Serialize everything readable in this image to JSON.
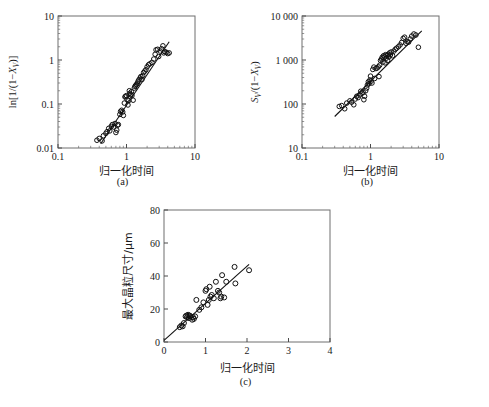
{
  "figure": {
    "panels": [
      {
        "id": "a",
        "caption": "(a)",
        "xlabel": "归一化时间",
        "ylabel_parts": {
          "prefix": "ln[1/(1−",
          "symbol": "X",
          "subscript": "V",
          "suffix": ")]"
        },
        "ylabel_text": "ln[1/(1−XV)]",
        "xticks": [
          "0.1",
          "1",
          "10"
        ],
        "yticks": [
          "0.01",
          "0.1",
          "1",
          "10"
        ]
      },
      {
        "id": "b",
        "caption": "(b)",
        "xlabel": "归一化时间",
        "ylabel_parts": {
          "prefix": "S",
          "sub1": "V",
          "mid": "/(1−",
          "symbol": "X",
          "subscript": "V",
          "suffix": ")"
        },
        "ylabel_text": "SV/(1−XV)",
        "xticks": [
          "0.1",
          "1",
          "10"
        ],
        "yticks": [
          "10",
          "100",
          "1 000",
          "10 000"
        ]
      },
      {
        "id": "c",
        "caption": "(c)",
        "xlabel": "归一化时间",
        "ylabel_text": "最大晶粒尺寸/μm",
        "xticks": [
          "0",
          "1",
          "2",
          "3",
          "4"
        ],
        "yticks": [
          "0",
          "20",
          "40",
          "60",
          "80"
        ]
      }
    ],
    "colors": {
      "axis": "#3a3a3a",
      "marker_stroke": "#111111",
      "fit_line": "#111111",
      "background": "#ffffff"
    }
  },
  "chart_data": [
    {
      "type": "scatter",
      "panel": "a",
      "title": "",
      "xlabel": "归一化时间",
      "ylabel": "ln[1/(1−XV)]",
      "xscale": "log",
      "yscale": "log",
      "xlim": [
        0.1,
        10
      ],
      "ylim": [
        0.01,
        10
      ],
      "xticks": [
        0.1,
        1,
        10
      ],
      "yticks": [
        0.01,
        0.1,
        1,
        10
      ],
      "grid": false,
      "legend": null,
      "fit_line": {
        "x": [
          0.42,
          4.2
        ],
        "y": [
          0.0125,
          2.6
        ]
      },
      "points": [
        [
          0.37,
          0.015
        ],
        [
          0.4,
          0.0165
        ],
        [
          0.44,
          0.0145
        ],
        [
          0.46,
          0.019
        ],
        [
          0.5,
          0.0215
        ],
        [
          0.52,
          0.0235
        ],
        [
          0.55,
          0.028
        ],
        [
          0.57,
          0.0245
        ],
        [
          0.6,
          0.031
        ],
        [
          0.62,
          0.034
        ],
        [
          0.65,
          0.03
        ],
        [
          0.68,
          0.036
        ],
        [
          0.7,
          0.0225
        ],
        [
          0.72,
          0.0255
        ],
        [
          0.74,
          0.033
        ],
        [
          0.76,
          0.034
        ],
        [
          0.8,
          0.058
        ],
        [
          0.82,
          0.068
        ],
        [
          0.85,
          0.072
        ],
        [
          0.88,
          0.066
        ],
        [
          0.9,
          0.055
        ],
        [
          0.93,
          0.105
        ],
        [
          0.95,
          0.145
        ],
        [
          0.97,
          0.15
        ],
        [
          1.0,
          0.155
        ],
        [
          1.02,
          0.128
        ],
        [
          1.05,
          0.095
        ],
        [
          1.08,
          0.12
        ],
        [
          1.1,
          0.2
        ],
        [
          1.12,
          0.175
        ],
        [
          1.15,
          0.165
        ],
        [
          1.18,
          0.19
        ],
        [
          1.2,
          0.155
        ],
        [
          1.25,
          0.122
        ],
        [
          1.3,
          0.23
        ],
        [
          1.33,
          0.25
        ],
        [
          1.36,
          0.265
        ],
        [
          1.4,
          0.28
        ],
        [
          1.45,
          0.3
        ],
        [
          1.48,
          0.33
        ],
        [
          1.52,
          0.355
        ],
        [
          1.58,
          0.39
        ],
        [
          1.62,
          0.42
        ],
        [
          1.68,
          0.36
        ],
        [
          1.72,
          0.44
        ],
        [
          1.78,
          0.52
        ],
        [
          1.85,
          0.56
        ],
        [
          1.92,
          0.6
        ],
        [
          2.0,
          0.7
        ],
        [
          2.1,
          0.78
        ],
        [
          2.2,
          0.82
        ],
        [
          2.35,
          0.88
        ],
        [
          2.5,
          1.05
        ],
        [
          2.62,
          1.35
        ],
        [
          2.7,
          1.7
        ],
        [
          2.85,
          1.75
        ],
        [
          2.95,
          1.2
        ],
        [
          3.1,
          1.6
        ],
        [
          3.25,
          1.8
        ],
        [
          3.4,
          2.1
        ],
        [
          3.5,
          1.45
        ],
        [
          3.6,
          1.55
        ],
        [
          3.8,
          1.5
        ],
        [
          4.0,
          1.4
        ],
        [
          4.2,
          1.45
        ]
      ]
    },
    {
      "type": "scatter",
      "panel": "b",
      "title": "",
      "xlabel": "归一化时间",
      "ylabel": "SV/(1−XV)",
      "xscale": "log",
      "yscale": "log",
      "xlim": [
        0.1,
        10
      ],
      "ylim": [
        10,
        10000
      ],
      "xticks": [
        0.1,
        1,
        10
      ],
      "yticks": [
        10,
        100,
        1000,
        10000
      ],
      "grid": false,
      "legend": null,
      "fit_line": {
        "x": [
          0.3,
          5.6
        ],
        "y": [
          52,
          4600
        ]
      },
      "points": [
        [
          0.35,
          88
        ],
        [
          0.38,
          92
        ],
        [
          0.42,
          78
        ],
        [
          0.45,
          105
        ],
        [
          0.5,
          118
        ],
        [
          0.53,
          110
        ],
        [
          0.57,
          96
        ],
        [
          0.6,
          130
        ],
        [
          0.63,
          150
        ],
        [
          0.66,
          140
        ],
        [
          0.7,
          160
        ],
        [
          0.72,
          195
        ],
        [
          0.75,
          175
        ],
        [
          0.78,
          185
        ],
        [
          0.8,
          125
        ],
        [
          0.82,
          150
        ],
        [
          0.85,
          200
        ],
        [
          0.88,
          230
        ],
        [
          0.9,
          270
        ],
        [
          0.93,
          320
        ],
        [
          0.95,
          290
        ],
        [
          0.98,
          350
        ],
        [
          1.0,
          430
        ],
        [
          1.02,
          330
        ],
        [
          1.05,
          300
        ],
        [
          1.08,
          610
        ],
        [
          1.12,
          690
        ],
        [
          1.15,
          380
        ],
        [
          1.2,
          640
        ],
        [
          1.25,
          660
        ],
        [
          1.3,
          700
        ],
        [
          1.33,
          420
        ],
        [
          1.36,
          760
        ],
        [
          1.4,
          980
        ],
        [
          1.45,
          1050
        ],
        [
          1.48,
          1150
        ],
        [
          1.52,
          900
        ],
        [
          1.55,
          1250
        ],
        [
          1.6,
          1180
        ],
        [
          1.63,
          860
        ],
        [
          1.66,
          1320
        ],
        [
          1.7,
          1100
        ],
        [
          1.74,
          1280
        ],
        [
          1.78,
          980
        ],
        [
          1.82,
          1350
        ],
        [
          1.86,
          1180
        ],
        [
          1.9,
          1450
        ],
        [
          1.95,
          1300
        ],
        [
          2.0,
          1520
        ],
        [
          2.1,
          1250
        ],
        [
          2.2,
          1600
        ],
        [
          2.3,
          1750
        ],
        [
          2.4,
          1850
        ],
        [
          2.55,
          2000
        ],
        [
          2.7,
          2200
        ],
        [
          2.85,
          2500
        ],
        [
          3.0,
          3100
        ],
        [
          3.15,
          3300
        ],
        [
          3.3,
          2400
        ],
        [
          3.45,
          2600
        ],
        [
          3.6,
          2550
        ],
        [
          3.8,
          3000
        ],
        [
          4.0,
          3500
        ],
        [
          4.3,
          3900
        ],
        [
          4.6,
          3700
        ],
        [
          5.0,
          1950
        ]
      ]
    },
    {
      "type": "scatter",
      "panel": "c",
      "title": "",
      "xlabel": "归一化时间",
      "ylabel": "最大晶粒尺寸/μm",
      "xscale": "linear",
      "yscale": "linear",
      "xlim": [
        0,
        4
      ],
      "ylim": [
        0,
        80
      ],
      "xticks": [
        0,
        1,
        2,
        3,
        4
      ],
      "yticks": [
        0,
        20,
        40,
        60,
        80
      ],
      "grid": false,
      "legend": null,
      "fit_line": {
        "x": [
          0.0,
          2.05
        ],
        "y": [
          1.0,
          47.0
        ]
      },
      "points": [
        [
          0.38,
          9.0
        ],
        [
          0.42,
          10.0
        ],
        [
          0.45,
          9.5
        ],
        [
          0.48,
          11.5
        ],
        [
          0.52,
          15.5
        ],
        [
          0.54,
          16.0
        ],
        [
          0.56,
          15.0
        ],
        [
          0.58,
          16.5
        ],
        [
          0.6,
          14.5
        ],
        [
          0.62,
          16.0
        ],
        [
          0.64,
          15.5
        ],
        [
          0.68,
          13.5
        ],
        [
          0.7,
          15.0
        ],
        [
          0.72,
          14.0
        ],
        [
          0.75,
          15.5
        ],
        [
          0.78,
          25.5
        ],
        [
          0.85,
          19.5
        ],
        [
          0.9,
          21.0
        ],
        [
          0.95,
          24.0
        ],
        [
          1.0,
          31.0
        ],
        [
          1.02,
          32.0
        ],
        [
          1.05,
          22.5
        ],
        [
          1.08,
          25.5
        ],
        [
          1.1,
          33.5
        ],
        [
          1.12,
          27.5
        ],
        [
          1.15,
          28.5
        ],
        [
          1.2,
          26.5
        ],
        [
          1.25,
          36.5
        ],
        [
          1.3,
          31.0
        ],
        [
          1.33,
          30.0
        ],
        [
          1.36,
          26.5
        ],
        [
          1.38,
          27.5
        ],
        [
          1.4,
          40.5
        ],
        [
          1.45,
          27.0
        ],
        [
          1.5,
          36.5
        ],
        [
          1.7,
          45.5
        ],
        [
          1.72,
          35.5
        ],
        [
          2.05,
          43.5
        ]
      ]
    }
  ]
}
